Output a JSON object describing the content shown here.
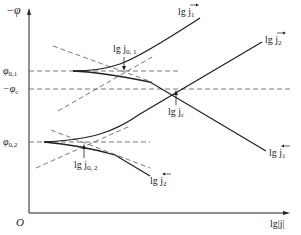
{
  "diagram": {
    "axes": {
      "y_label": "−φ",
      "x_label": "lg|j|",
      "origin_label": "O"
    },
    "levels": {
      "phi_01": "φ",
      "phi_01_sub": "0,1",
      "phi_c": "−φ",
      "phi_c_sub": "c",
      "phi_02": "φ",
      "phi_02_sub": "0,2"
    },
    "curve_labels": {
      "j1_forward": "lg j",
      "j1_forward_sub": "1",
      "j2_forward": "lg j",
      "j2_forward_sub": "2",
      "j1_backward": "lg j",
      "j1_backward_sub": "1",
      "j2_backward": "lg j",
      "j2_backward_sub": "2"
    },
    "annotations": {
      "j01": "lg j",
      "j01_sub": "0, 1",
      "jc": "lg j",
      "jc_sub": "c",
      "j02": "lg j",
      "j02_sub": "0, 2"
    },
    "colors": {
      "line": "#222222",
      "dashed": "#555555",
      "background": "#ffffff"
    }
  }
}
